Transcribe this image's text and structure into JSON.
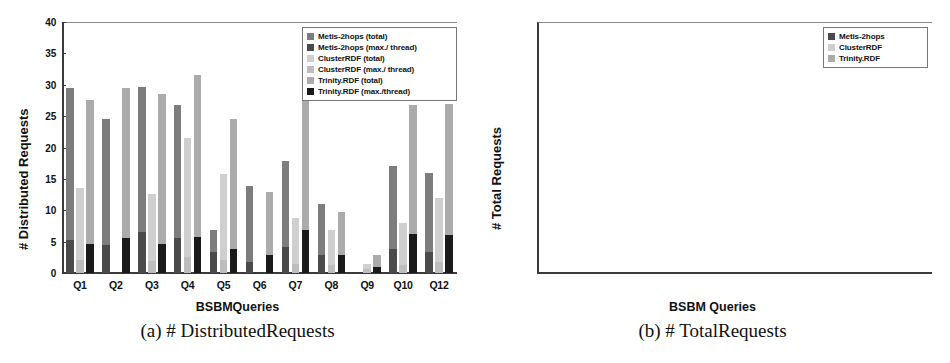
{
  "figure": {
    "panels": [
      "a",
      "b"
    ]
  },
  "colors": {
    "metis_total": "#7d7d7d",
    "metis_max": "#4a4a4a",
    "cluster_total": "#cfcfcf",
    "cluster_max": "#bdbdbd",
    "trinity_total": "#ababab",
    "trinity_max": "#1a1a1a",
    "axis": "#3a3a3a",
    "frame": "#8a8a8a"
  },
  "left": {
    "caption": "(a) # DistributedRequests",
    "chart_data": {
      "type": "bar",
      "title": "",
      "subtitle": "",
      "xlabel": "BSBMQueries",
      "ylabel": "# Distributed Requests",
      "ylim": [
        0,
        40
      ],
      "yticks": [
        "0",
        "5",
        "10",
        "15",
        "20",
        "25",
        "30",
        "35",
        "40"
      ],
      "ytick_values": [
        0,
        5,
        10,
        15,
        20,
        25,
        30,
        35,
        40
      ],
      "grid": false,
      "legend_position": "top-right",
      "scale": "linear",
      "stacked": true,
      "categories": [
        "Q1",
        "Q2",
        "Q3",
        "Q4",
        "Q5",
        "Q6",
        "Q7",
        "Q8",
        "Q9",
        "Q10",
        "Q12"
      ],
      "legend": [
        "Metis-2hops (total)",
        "Metis-2hops (max./ thread)",
        "ClusterRDF (total)",
        "ClusterRDF (max./ thread)",
        "Trinity.RDF (total)",
        "Trinity.RDF (max./thread)"
      ],
      "series": [
        {
          "name": "Metis-2hops (total)",
          "values": [
            29.5,
            24.6,
            29.6,
            26.7,
            6.8,
            13.9,
            17.8,
            11.0,
            0.0,
            17.0,
            16.0
          ]
        },
        {
          "name": "Metis-2hops (max./ thread)",
          "values": [
            5.3,
            4.5,
            6.6,
            5.5,
            3.3,
            1.7,
            4.1,
            2.8,
            0.0,
            3.8,
            3.4
          ]
        },
        {
          "name": "ClusterRDF (total)",
          "values": [
            13.5,
            0.0,
            12.6,
            21.5,
            15.7,
            0.0,
            8.8,
            6.9,
            1.5,
            7.9,
            12.0
          ]
        },
        {
          "name": "ClusterRDF (max./ thread)",
          "values": [
            2.0,
            0.0,
            1.9,
            2.6,
            2.1,
            0.0,
            1.4,
            1.2,
            0.7,
            1.3,
            1.8
          ]
        },
        {
          "name": "Trinity.RDF (total)",
          "values": [
            27.5,
            29.5,
            28.5,
            31.6,
            24.6,
            12.9,
            32.8,
            9.7,
            2.8,
            26.8,
            26.9
          ]
        },
        {
          "name": "Trinity.RDF (max./thread)",
          "values": [
            4.6,
            5.6,
            4.7,
            5.8,
            3.9,
            2.9,
            6.9,
            2.9,
            0.9,
            6.2,
            6.0
          ]
        }
      ]
    }
  },
  "right": {
    "caption": "(b) # TotalRequests",
    "chart_data": {
      "type": "bar",
      "title": "",
      "subtitle": "",
      "xlabel": "BSBM Queries",
      "ylabel": "# Total Requests",
      "ylim": [
        0.4,
        4000
      ],
      "scale": "log",
      "yticks": [
        "0.4",
        "1",
        "2",
        "4",
        "10",
        "20",
        "40",
        "100",
        "200",
        "400",
        "1k",
        "2k",
        "4k"
      ],
      "ytick_values": [
        0.4,
        1,
        2,
        4,
        10,
        20,
        40,
        100,
        200,
        400,
        1000,
        2000,
        4000
      ],
      "grid": false,
      "legend_position": "top-right",
      "stacked": false,
      "categories": [
        "Q1",
        "Q2",
        "Q3",
        "Q4",
        "Q5",
        "Q6",
        "Q7",
        "Q8",
        "Q9",
        "Q10",
        "Q12"
      ],
      "legend": [
        "Metis-2hops",
        "ClusterRDF",
        "Trinity.RDF"
      ],
      "series": [
        {
          "name": "Metis-2hops",
          "values": [
            8,
            15,
            10,
            10,
            5,
            95,
            45,
            32,
            2,
            45,
            8
          ]
        },
        {
          "name": "ClusterRDF",
          "values": [
            17,
            0.85,
            17,
            21,
            20,
            130,
            35,
            23,
            1.05,
            25,
            3.2
          ]
        },
        {
          "name": "Trinity.RDF",
          "values": [
            70,
            65,
            700,
            650,
            95,
            2500,
            150,
            31,
            2,
            95,
            25
          ]
        }
      ]
    }
  }
}
